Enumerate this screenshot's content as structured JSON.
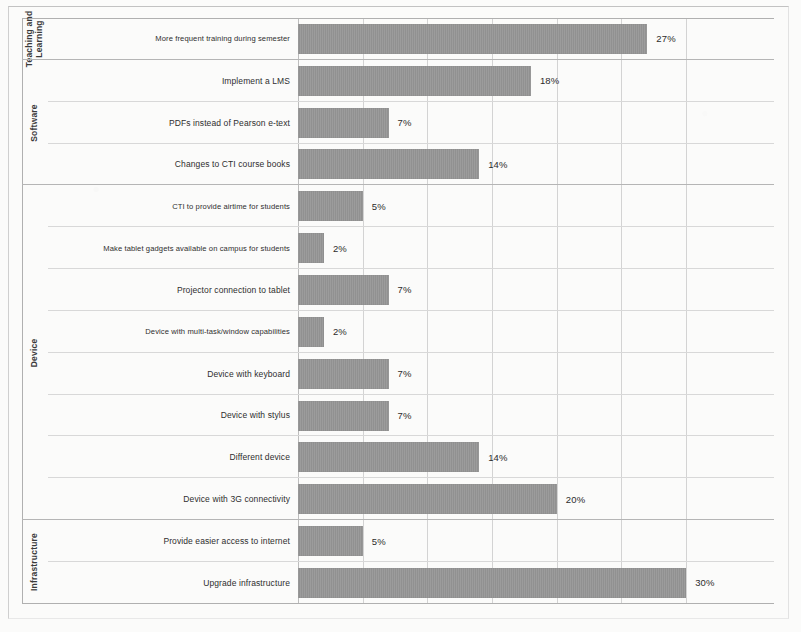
{
  "chart_data": {
    "type": "bar",
    "orientation": "horizontal",
    "title": "",
    "xlabel": "",
    "ylabel": "",
    "xlim": [
      0,
      32
    ],
    "grid": true,
    "gridline_interval": 5,
    "legend": "none",
    "value_suffix": "%",
    "bar_color": "#969696",
    "groups": [
      {
        "name": "Teaching and Learning"
      },
      {
        "name": "Software"
      },
      {
        "name": "Device"
      },
      {
        "name": "Infrastructure"
      }
    ],
    "categories": [
      "More frequent training during semester",
      "Implement a LMS",
      "PDFs instead of Pearson e-text",
      "Changes to CTI course books",
      "CTI to provide airtime for students",
      "Make tablet gadgets available on campus for students",
      "Projector connection to tablet",
      "Device with multi-task/window capabilities",
      "Device with keyboard",
      "Device with stylus",
      "Different device",
      "Device with 3G connectivity",
      "Provide easier access to internet",
      "Upgrade infrastructure"
    ],
    "values": [
      27,
      18,
      7,
      14,
      5,
      2,
      7,
      2,
      7,
      7,
      14,
      20,
      5,
      30
    ],
    "value_labels": [
      "27%",
      "18%",
      "7%",
      "14%",
      "5%",
      "2%",
      "7%",
      "2%",
      "7%",
      "7%",
      "14%",
      "20%",
      "5%",
      "30%"
    ],
    "rows": [
      {
        "group": "Teaching and Learning",
        "group_span": 1,
        "label": "More frequent training during semester",
        "value": 27,
        "value_label": "27%"
      },
      {
        "group": "Software",
        "group_span": 3,
        "label": "Implement a LMS",
        "value": 18,
        "value_label": "18%"
      },
      {
        "group": "",
        "group_span": 0,
        "label": "PDFs instead of Pearson e-text",
        "value": 7,
        "value_label": "7%"
      },
      {
        "group": "",
        "group_span": 0,
        "label": "Changes to CTI course books",
        "value": 14,
        "value_label": "14%"
      },
      {
        "group": "Device",
        "group_span": 8,
        "label": "CTI to provide airtime for students",
        "value": 5,
        "value_label": "5%"
      },
      {
        "group": "",
        "group_span": 0,
        "label": "Make tablet gadgets available on campus for students",
        "value": 2,
        "value_label": "2%"
      },
      {
        "group": "",
        "group_span": 0,
        "label": "Projector connection to tablet",
        "value": 7,
        "value_label": "7%"
      },
      {
        "group": "",
        "group_span": 0,
        "label": "Device with multi-task/window capabilities",
        "value": 2,
        "value_label": "2%"
      },
      {
        "group": "",
        "group_span": 0,
        "label": "Device with keyboard",
        "value": 7,
        "value_label": "7%"
      },
      {
        "group": "",
        "group_span": 0,
        "label": "Device with stylus",
        "value": 7,
        "value_label": "7%"
      },
      {
        "group": "",
        "group_span": 0,
        "label": "Different device",
        "value": 14,
        "value_label": "14%"
      },
      {
        "group": "",
        "group_span": 0,
        "label": "Device with 3G connectivity",
        "value": 20,
        "value_label": "20%"
      },
      {
        "group": "Infrastructure",
        "group_span": 2,
        "label": "Provide easier access to internet",
        "value": 5,
        "value_label": "5%"
      },
      {
        "group": "",
        "group_span": 0,
        "label": "Upgrade infrastructure",
        "value": 30,
        "value_label": "30%"
      }
    ],
    "gridlines": [
      0,
      5,
      10,
      15,
      20,
      25,
      30
    ]
  }
}
